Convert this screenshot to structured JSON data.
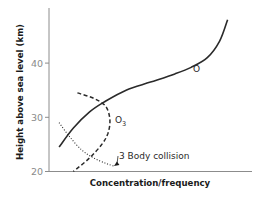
{
  "chart_data": {
    "type": "line",
    "title": "",
    "xlabel": "Concentration/frequency",
    "ylabel": "Height above sea level (km)",
    "ylim": [
      20,
      49
    ],
    "yticks": [
      20,
      30,
      40
    ],
    "ytick_labels": [
      "20",
      "30",
      "40"
    ],
    "xticks": [],
    "xlim": [
      0,
      100
    ],
    "grid": false,
    "legend": "none",
    "series": [
      {
        "name": "O",
        "label": "O",
        "style": "solid",
        "points": [
          [
            5,
            24.5
          ],
          [
            12,
            28
          ],
          [
            20,
            31
          ],
          [
            28,
            33
          ],
          [
            38,
            35
          ],
          [
            50,
            36.5
          ],
          [
            62,
            38
          ],
          [
            70,
            39.2
          ],
          [
            78,
            41
          ],
          [
            84,
            44
          ],
          [
            88,
            48
          ]
        ]
      },
      {
        "name": "O3",
        "label": "O",
        "label_sub": "3",
        "style": "dashed",
        "points": [
          [
            14,
            34.5
          ],
          [
            22,
            33.5
          ],
          [
            28,
            32
          ],
          [
            30,
            29.5
          ],
          [
            29,
            27
          ],
          [
            26,
            25
          ],
          [
            20,
            22.5
          ],
          [
            12,
            20
          ]
        ]
      },
      {
        "name": "3 Body collision",
        "style": "dotted",
        "points": [
          [
            5,
            29
          ],
          [
            10,
            26.5
          ],
          [
            16,
            24
          ],
          [
            22,
            22.5
          ],
          [
            28,
            21.5
          ],
          [
            32,
            21
          ]
        ]
      }
    ],
    "annotations": [
      {
        "text": "3 Body collision",
        "target_series": "3 Body collision",
        "target_point": [
          32,
          21
        ],
        "arrow": true
      }
    ]
  }
}
